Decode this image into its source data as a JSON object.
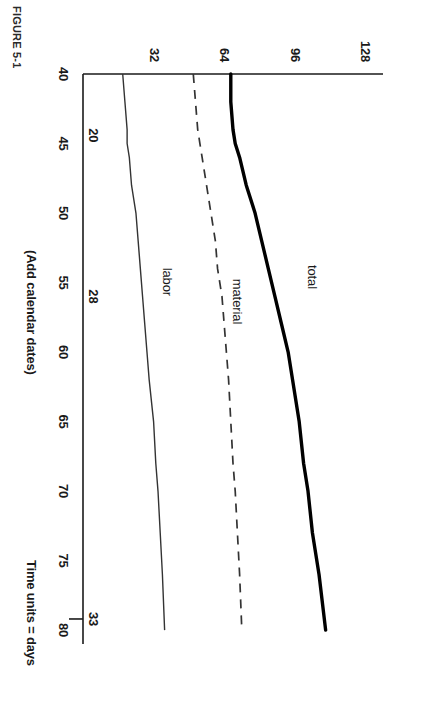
{
  "chart_data": {
    "type": "line",
    "title": "",
    "xlabel": "Time units = days",
    "xlabel_secondary": "(Add calendar dates)",
    "ylabel": "",
    "xlim": [
      40,
      81
    ],
    "ylim": [
      0,
      136
    ],
    "grid": false,
    "legend": "inline-labels",
    "xticks": [
      40,
      45,
      50,
      55,
      60,
      65,
      70,
      75,
      80
    ],
    "xticklabels": [
      "40",
      "45",
      "50",
      "55",
      "60",
      "65",
      "70",
      "75",
      "80"
    ],
    "yticks": [
      32,
      64,
      96,
      128
    ],
    "yticklabels": [
      "32",
      "64",
      "96",
      "128"
    ],
    "secondary_xticks": [
      {
        "x": 44.4,
        "label": "20"
      },
      {
        "x": 56.0,
        "label": "28"
      },
      {
        "x": 79.2,
        "label": "33"
      }
    ],
    "series": [
      {
        "name": "total",
        "style": "solid-thick",
        "label_x": 55.6,
        "label_y": 104,
        "x": [
          40,
          42,
          44,
          45,
          46,
          48,
          50,
          52,
          54,
          56,
          58,
          60,
          62,
          65,
          68,
          70,
          73,
          76,
          80
        ],
        "values": [
          67,
          67,
          68,
          69,
          71,
          74,
          78,
          81,
          84,
          87,
          90,
          93,
          95,
          98,
          100,
          102,
          104,
          107,
          110
        ]
      },
      {
        "name": "material",
        "style": "dashed",
        "label_x": 56.6,
        "label_y": 70,
        "x": [
          40,
          42,
          44,
          45,
          46,
          48,
          50,
          52,
          54,
          56,
          58,
          60,
          62,
          65,
          68,
          70,
          73,
          76,
          80
        ],
        "values": [
          50,
          51,
          52,
          53,
          54,
          56,
          58,
          60,
          61,
          63,
          64,
          65,
          66,
          67,
          68,
          69,
          70,
          71,
          72
        ]
      },
      {
        "name": "labor",
        "style": "solid-thin",
        "label_x": 55.8,
        "label_y": 38,
        "x": [
          40,
          42,
          44,
          45,
          46,
          48,
          50,
          52,
          54,
          56,
          58,
          60,
          62,
          65,
          68,
          70,
          73,
          76,
          80
        ],
        "values": [
          18,
          19,
          20,
          20,
          21,
          22,
          24,
          25,
          26,
          27,
          28,
          29,
          30,
          32,
          33,
          34,
          35,
          36,
          37
        ]
      }
    ]
  },
  "figure": {
    "caption": "FIGURE 5-1"
  },
  "colors": {
    "axis": "#1a1a1a",
    "total": "#000000",
    "material": "#333333",
    "labor": "#333333"
  }
}
